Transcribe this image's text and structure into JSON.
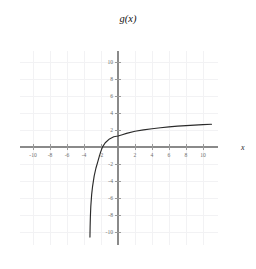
{
  "chart_data": {
    "type": "line",
    "title": "g(x)",
    "xlabel": "x",
    "ylabel": "",
    "xlim": [
      -11.5,
      11.8
    ],
    "ylim": [
      -11.5,
      11.3
    ],
    "grid": true,
    "grid_step": 2,
    "legend": null,
    "x_ticks": [
      -10,
      -8,
      -6,
      -4,
      -2,
      2,
      4,
      6,
      8,
      10
    ],
    "x_tick_labels": [
      "-10",
      "-8",
      "-6",
      "-4",
      "-2",
      "2",
      "4",
      "6",
      "8",
      "10"
    ],
    "y_ticks": [
      -10,
      -8,
      -6,
      -4,
      -2,
      2,
      4,
      6,
      8,
      10
    ],
    "y_tick_labels": [
      "-10",
      "-8",
      "-6",
      "-4",
      "-2",
      "2",
      "4",
      "6",
      "8",
      "10"
    ],
    "series": [
      {
        "name": "g(x)",
        "color": "#2b2b2b",
        "vertical_asymptote": -3.35,
        "x_intercept": -2.05,
        "y_intercept": 1.3,
        "x": [
          -3.3,
          -3.28,
          -3.25,
          -3.2,
          -3.1,
          -3.0,
          -2.8,
          -2.6,
          -2.4,
          -2.2,
          -2.05,
          -1.8,
          -1.5,
          -1.0,
          -0.5,
          0,
          0.5,
          1,
          2,
          3,
          4,
          5,
          6,
          7,
          8,
          9,
          10,
          11
        ],
        "y": [
          -10.6,
          -9.4,
          -8.2,
          -7.0,
          -5.6,
          -4.7,
          -3.4,
          -2.5,
          -1.8,
          -1.1,
          -0.6,
          0.05,
          0.5,
          0.95,
          1.2,
          1.3,
          1.45,
          1.6,
          1.85,
          2.02,
          2.15,
          2.27,
          2.37,
          2.45,
          2.52,
          2.58,
          2.63,
          2.68
        ]
      }
    ],
    "annotations": [],
    "colors": {
      "curve": "#2b2b2b",
      "axis": "#8a8a8a",
      "grid": "#f2f2f4",
      "tick_text": "#6e6e6e",
      "title_text": "#111111",
      "background": "#ffffff"
    }
  },
  "labels": {
    "title": "g(x)",
    "x_axis_name": "x"
  }
}
